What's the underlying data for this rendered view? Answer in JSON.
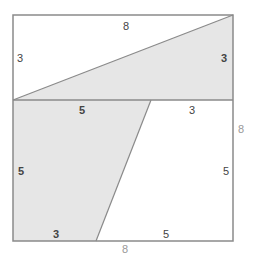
{
  "diagram": {
    "colors": {
      "stroke": "#8a8a8a",
      "shaded_fill": "#e6e6e6",
      "background": "#ffffff",
      "inner_label": "#444444",
      "outer_label": "#999999"
    },
    "labels": {
      "top_width": "8",
      "top_left_height": "3",
      "triangle_right_height": "3",
      "mid_left_segment": "5",
      "mid_right_segment": "3",
      "outer_right_height": "8",
      "lower_left_height": "5",
      "lower_right_height": "5",
      "bottom_left_segment": "3",
      "bottom_right_segment": "5",
      "outer_bottom_width": "8"
    }
  }
}
